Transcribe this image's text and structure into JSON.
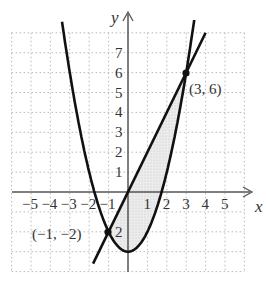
{
  "figure": {
    "axes": {
      "x_label": "x",
      "y_label": "y",
      "x_ticks": [
        "−5",
        "−4",
        "−3",
        "−2",
        "−1",
        "1",
        "2",
        "3",
        "4",
        "5"
      ],
      "x_tick_values": [
        -5,
        -4,
        -3,
        -2,
        -1,
        1,
        2,
        3,
        4,
        5
      ],
      "y_ticks": [
        "7",
        "6",
        "5",
        "4",
        "3",
        "2",
        "1",
        "2"
      ],
      "y_tick_values": [
        7,
        6,
        5,
        4,
        3,
        2,
        1,
        -2
      ],
      "x_range": [
        -6,
        6
      ],
      "y_range": [
        -4,
        8
      ],
      "grid": "dotted"
    },
    "curves": [
      {
        "name": "parabola",
        "equation": "y = x^2 - 3"
      },
      {
        "name": "line",
        "equation": "y = 2x"
      }
    ],
    "points": [
      {
        "label": "(3, 6)",
        "x": 3,
        "y": 6
      },
      {
        "label": "(−1, −2)",
        "x": -1,
        "y": -2
      }
    ],
    "shaded_region": "between y = 2x and y = x^2 - 3 for -1 ≤ x ≤ 3",
    "colors": {
      "curve": "#111111",
      "grid": "#bbbbbb",
      "shade": "#e4e4e4",
      "axis": "#555555"
    }
  }
}
